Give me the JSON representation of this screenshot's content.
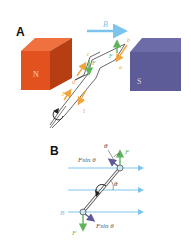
{
  "panels": [
    {
      "label": "A",
      "magnets": {
        "north": "N",
        "south": "S"
      },
      "field_label": "B",
      "force_label": "F",
      "corner_labels": [
        "a",
        "b",
        "c",
        "d"
      ],
      "current_label": "I"
    },
    {
      "label": "B",
      "field_label": "B",
      "force_label": "F",
      "component_label": "Fsin θ",
      "angle_label": "θ"
    }
  ],
  "colors": {
    "north": "#e2521f",
    "north_dark": "#b73d12",
    "north_top": "#f07040",
    "south": "#5d5b98",
    "south_dark": "#4b4982",
    "south_top": "#6e6ca8",
    "field": "#7cc4ec",
    "force": "#5fb35a",
    "current": "#f2a33a",
    "component": "#5d5b98"
  }
}
